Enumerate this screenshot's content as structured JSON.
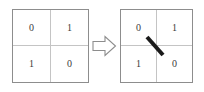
{
  "figure": {
    "caption": "",
    "colors": {
      "grid_border": "#8d8d8d",
      "grid_inner_line": "#c4c4c4",
      "digit": "#3a3a3a",
      "arrow_outline": "#8d8d8d",
      "arrow_fill": "#ffffff",
      "stroke": "#1a1a1a",
      "background": "#ffffff"
    },
    "grids": [
      {
        "id": "left",
        "name": "source-grid",
        "rows": 2,
        "cols": 2,
        "cells": [
          [
            "0",
            "1"
          ],
          [
            "1",
            "0"
          ]
        ],
        "has_stroke": false
      },
      {
        "id": "right",
        "name": "result-grid",
        "rows": 2,
        "cols": 2,
        "cells": [
          [
            "0",
            "1"
          ],
          [
            "1",
            "0"
          ]
        ],
        "has_stroke": true,
        "stroke": {
          "name": "diagonal-slash",
          "x1": 147,
          "y1": 37,
          "x2": 163,
          "y2": 55,
          "width": 4
        }
      }
    ],
    "arrow": {
      "name": "transform-arrow",
      "direction": "right",
      "label": ""
    }
  }
}
